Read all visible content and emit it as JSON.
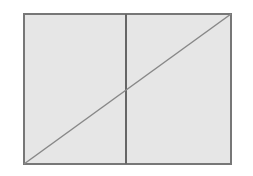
{
  "diagram": {
    "colors": {
      "background": "#ffffff",
      "fill": "#e6e6e6",
      "stroke": "#777777"
    },
    "rectangle": {
      "x": 24,
      "y": 14,
      "width": 207,
      "height": 150
    },
    "vertical_divider": {
      "x": 126,
      "y1": 14,
      "y2": 164
    },
    "diagonal": {
      "x1": 24,
      "y1": 164,
      "x2": 231,
      "y2": 14
    }
  }
}
